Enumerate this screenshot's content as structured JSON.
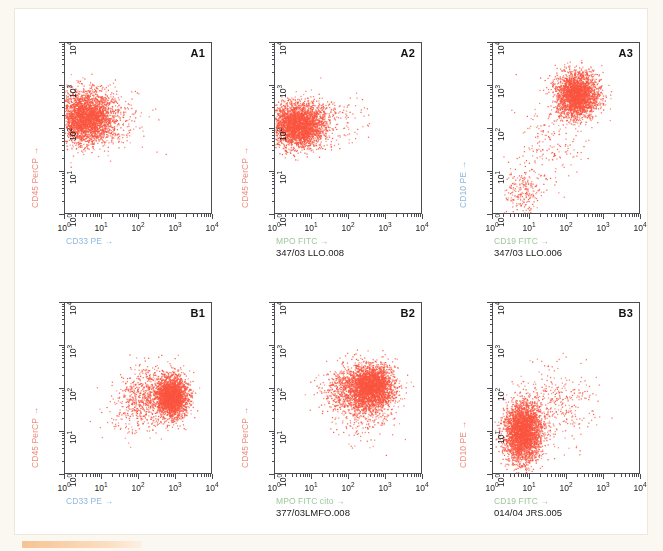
{
  "figure": {
    "background_color": "#fbf7f1",
    "panel_color": "#ffffff",
    "dot_color": "#fa5540",
    "frame_color": "#4b4b52",
    "accent_bar_color": "#f6c394",
    "bottom_bar_name": "orange-highlight-bar"
  },
  "axis": {
    "tick_labels": [
      "10⁰",
      "10¹",
      "10²",
      "10³",
      "10⁴"
    ],
    "decades": 4,
    "xlim": [
      1,
      10000
    ],
    "ylim": [
      1,
      10000
    ],
    "scale": "log"
  },
  "chart_data": [
    {
      "type": "scatter",
      "id": "A1",
      "title": "A1",
      "xlabel": "CD33 PE →",
      "ylabel": "CD45 PerCP →",
      "xlabel_color": "#8fb8dd",
      "ylabel_color": "#f08e7e",
      "caption": "",
      "xlim": [
        1,
        10000
      ],
      "ylim": [
        1,
        10000
      ],
      "xticklabels": [
        "10⁰",
        "10¹",
        "10²",
        "10³",
        "10⁴"
      ],
      "yticklabels": [
        "10⁰",
        "10¹",
        "10²",
        "10³",
        "10⁴"
      ],
      "grid": false,
      "clusters": [
        {
          "name": "main-blast-population",
          "cx_log": 0.55,
          "cy_log": 2.28,
          "sx_log": 0.38,
          "sy_log": 0.3,
          "n": 3000
        },
        {
          "name": "sparse-tail",
          "cx_log": 1.35,
          "cy_log": 2.25,
          "sx_log": 0.45,
          "sy_log": 0.35,
          "n": 180
        }
      ]
    },
    {
      "type": "scatter",
      "id": "A2",
      "title": "A2",
      "xlabel": "MPO FITC →",
      "ylabel": "CD45 PerCP →",
      "xlabel_color": "#9ec79b",
      "ylabel_color": "#f08e7e",
      "caption": "347/03 LLO.008",
      "xlim": [
        1,
        10000
      ],
      "ylim": [
        1,
        10000
      ],
      "xticklabels": [
        "10⁰",
        "10¹",
        "10²",
        "10³",
        "10⁴"
      ],
      "yticklabels": [
        "10⁰",
        "10¹",
        "10²",
        "10³",
        "10⁴"
      ],
      "grid": false,
      "clusters": [
        {
          "name": "main-blast-population",
          "cx_log": 0.62,
          "cy_log": 2.1,
          "sx_log": 0.36,
          "sy_log": 0.26,
          "n": 3000
        },
        {
          "name": "sparse-tail",
          "cx_log": 1.55,
          "cy_log": 2.15,
          "sx_log": 0.48,
          "sy_log": 0.3,
          "n": 150
        }
      ]
    },
    {
      "type": "scatter",
      "id": "A3",
      "title": "A3",
      "xlabel": "CD19 FITC →",
      "ylabel": "CD10 PE →",
      "xlabel_color": "#9ec79b",
      "ylabel_color": "#8fb8dd",
      "caption": "347/03 LLO.006",
      "xlim": [
        1,
        10000
      ],
      "ylim": [
        1,
        10000
      ],
      "xticklabels": [
        "10⁰",
        "10¹",
        "10²",
        "10³",
        "10⁴"
      ],
      "yticklabels": [
        "10⁰",
        "10¹",
        "10²",
        "10³",
        "10⁴"
      ],
      "grid": false,
      "clusters": [
        {
          "name": "cd19-cd10-double-positive",
          "cx_log": 2.25,
          "cy_log": 2.8,
          "sx_log": 0.28,
          "sy_log": 0.26,
          "n": 2600
        },
        {
          "name": "negative-population",
          "cx_log": 0.78,
          "cy_log": 0.55,
          "sx_log": 0.22,
          "sy_log": 0.3,
          "n": 220
        },
        {
          "name": "diagonal-bridge",
          "cx_log": 1.55,
          "cy_log": 1.7,
          "sx_log": 0.45,
          "sy_log": 0.55,
          "n": 200
        }
      ]
    },
    {
      "type": "scatter",
      "id": "B1",
      "title": "B1",
      "xlabel": "CD33 PE →",
      "ylabel": "CD45 PerCP →",
      "xlabel_color": "#8fb8dd",
      "ylabel_color": "#f08e7e",
      "caption": "",
      "xlim": [
        1,
        10000
      ],
      "ylim": [
        1,
        10000
      ],
      "xticklabels": [
        "10⁰",
        "10¹",
        "10²",
        "10³",
        "10⁴"
      ],
      "yticklabels": [
        "10⁰",
        "10¹",
        "10²",
        "10³",
        "10⁴"
      ],
      "grid": false,
      "clusters": [
        {
          "name": "cd33-bright-population",
          "cx_log": 2.88,
          "cy_log": 1.82,
          "sx_log": 0.22,
          "sy_log": 0.24,
          "n": 2400
        },
        {
          "name": "intermediate-spread",
          "cx_log": 2.25,
          "cy_log": 1.9,
          "sx_log": 0.35,
          "sy_log": 0.32,
          "n": 600
        },
        {
          "name": "low-tail",
          "cx_log": 1.75,
          "cy_log": 1.45,
          "sx_log": 0.38,
          "sy_log": 0.3,
          "n": 150
        }
      ]
    },
    {
      "type": "scatter",
      "id": "B2",
      "title": "B2",
      "xlabel": "MPO FITC cito →",
      "ylabel": "CD45 PerCP →",
      "xlabel_color": "#9ec79b",
      "ylabel_color": "#f08e7e",
      "caption": "377/03LMFO.008",
      "xlim": [
        1,
        10000
      ],
      "ylim": [
        1,
        10000
      ],
      "xticklabels": [
        "10⁰",
        "10¹",
        "10²",
        "10³",
        "10⁴"
      ],
      "yticklabels": [
        "10⁰",
        "10¹",
        "10²",
        "10³",
        "10⁴"
      ],
      "grid": false,
      "clusters": [
        {
          "name": "mpo-positive-population",
          "cx_log": 2.6,
          "cy_log": 2.05,
          "sx_log": 0.3,
          "sy_log": 0.26,
          "n": 2800
        },
        {
          "name": "left-spread",
          "cx_log": 1.95,
          "cy_log": 1.95,
          "sx_log": 0.35,
          "sy_log": 0.28,
          "n": 700
        },
        {
          "name": "low-scatter",
          "cx_log": 2.4,
          "cy_log": 1.35,
          "sx_log": 0.45,
          "sy_log": 0.3,
          "n": 180
        }
      ]
    },
    {
      "type": "scatter",
      "id": "B3",
      "title": "B3",
      "xlabel": "CD19 FITC →",
      "ylabel": "CD10 PE →",
      "xlabel_color": "#9ec79b",
      "ylabel_color": "#f08e7e",
      "caption": "014/04 JRS.005",
      "xlim": [
        1,
        10000
      ],
      "ylim": [
        1,
        10000
      ],
      "xticklabels": [
        "10⁰",
        "10¹",
        "10²",
        "10³",
        "10⁴"
      ],
      "yticklabels": [
        "10⁰",
        "10¹",
        "10²",
        "10³",
        "10⁴"
      ],
      "grid": false,
      "clusters": [
        {
          "name": "cd19-dim-cd10-low",
          "cx_log": 0.8,
          "cy_log": 1.0,
          "sx_log": 0.26,
          "sy_log": 0.36,
          "n": 3200
        },
        {
          "name": "diagonal-spread",
          "cx_log": 1.75,
          "cy_log": 1.65,
          "sx_log": 0.45,
          "sy_log": 0.45,
          "n": 320
        }
      ]
    }
  ]
}
